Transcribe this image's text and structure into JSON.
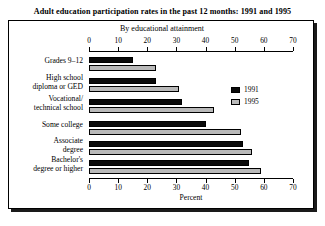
{
  "chart_data": {
    "type": "bar",
    "orientation": "horizontal",
    "title": "Adult education participation rates in the past 12 months: 1991 and 1995",
    "subtitle": "By educational attainment",
    "xlabel": "Percent",
    "ylabel": "",
    "xlim": [
      0,
      70
    ],
    "xticks": [
      0,
      10,
      20,
      30,
      40,
      50,
      60,
      70
    ],
    "grid": false,
    "legend_position": "upper-right",
    "categories": [
      "Grades 9–12",
      "High school diploma or GED",
      "Vocational/ technical school",
      "Some college",
      "Associate degree",
      "Bachelor's degree or higher"
    ],
    "category_lines": [
      [
        "Grades 9–12"
      ],
      [
        "High school",
        "diploma or GED"
      ],
      [
        "Vocational/",
        "technical school"
      ],
      [
        "Some college"
      ],
      [
        "Associate",
        "degree"
      ],
      [
        "Bachelor's",
        "degree or higher"
      ]
    ],
    "series": [
      {
        "name": "1991",
        "color": "#0a0a0a",
        "values": [
          15,
          23,
          32,
          40,
          53,
          55
        ]
      },
      {
        "name": "1995",
        "color": "#b9b9b9",
        "values": [
          23,
          31,
          43,
          52,
          56,
          59
        ]
      }
    ]
  }
}
